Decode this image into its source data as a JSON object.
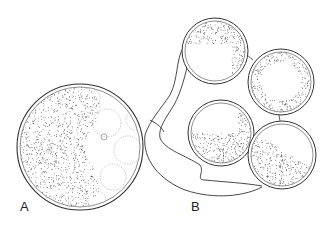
{
  "figure": {
    "labels": {
      "a": "A",
      "b": "B"
    },
    "panel_a": {
      "description": "Single large cyst/sphere, left half densely stippled, right half with polygonal cell outlines",
      "cx": 80,
      "cy": 147,
      "r": 63
    },
    "panel_b": {
      "description": "Four spheres attached to a branching stalk/tube",
      "spheres": [
        {
          "name": "top",
          "cx": 215,
          "cy": 51,
          "r": 33
        },
        {
          "name": "right",
          "cx": 281,
          "cy": 82,
          "r": 33
        },
        {
          "name": "middle",
          "cx": 221,
          "cy": 133,
          "r": 33
        },
        {
          "name": "bottom",
          "cx": 282,
          "cy": 155,
          "r": 34
        }
      ]
    },
    "colors": {
      "ink": "#333333",
      "background": "#ffffff"
    }
  }
}
